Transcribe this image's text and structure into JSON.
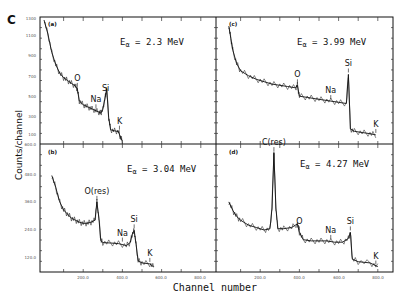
{
  "figure_label": "C",
  "ylabel": "Counts/channel",
  "xlabel": "Channel number",
  "chart_data": [
    {
      "type": "line",
      "panel": "(a)",
      "title": "Eα = 2.3 MeV",
      "energy_label": "2.3 MeV",
      "xlabel": "Channel number",
      "ylabel": "Counts/channel",
      "xlim": [
        0,
        900
      ],
      "ylim": [
        0,
        1300
      ],
      "yticks": [
        "1300",
        "1100",
        "900",
        "700",
        "500",
        "300",
        "100",
        "0.00"
      ],
      "xticks": [],
      "peaks": [
        {
          "label": "O",
          "channel": 170
        },
        {
          "label": "Na",
          "channel": 265
        },
        {
          "label": "Si",
          "channel": 315
        },
        {
          "label": "K",
          "channel": 385
        }
      ],
      "series": [
        {
          "name": "spectrum",
          "x": [
            0,
            20,
            40,
            60,
            80,
            100,
            120,
            140,
            160,
            170,
            180,
            200,
            220,
            240,
            260,
            280,
            290,
            300,
            310,
            320,
            330,
            340,
            360,
            380,
            390,
            400
          ],
          "y": [
            1300,
            1150,
            950,
            820,
            730,
            680,
            650,
            620,
            590,
            560,
            430,
            390,
            370,
            350,
            330,
            310,
            300,
            340,
            450,
            560,
            250,
            120,
            110,
            100,
            40,
            0
          ]
        }
      ]
    },
    {
      "type": "line",
      "panel": "(b)",
      "title": "Eα = 3.04 MeV",
      "energy_label": "3.04 MeV",
      "xlabel": "Channel number",
      "ylabel": "Counts/channel",
      "xlim": [
        0,
        900
      ],
      "ylim": [
        0,
        600
      ],
      "yticks": [
        "600.0",
        "480.0",
        "360.0",
        "240.0",
        "120.0"
      ],
      "xticks": [
        "200.0",
        "400.0",
        "600.0",
        "800.0"
      ],
      "peaks": [
        {
          "label": "O(res)",
          "channel": 270
        },
        {
          "label": "Na",
          "channel": 400
        },
        {
          "label": "Si",
          "channel": 460
        },
        {
          "label": "K",
          "channel": 540
        }
      ],
      "series": [
        {
          "name": "spectrum",
          "x": [
            40,
            60,
            80,
            100,
            120,
            140,
            160,
            180,
            200,
            220,
            240,
            260,
            270,
            280,
            290,
            300,
            340,
            380,
            420,
            440,
            450,
            460,
            470,
            480,
            500,
            540,
            560
          ],
          "y": [
            460,
            400,
            330,
            290,
            270,
            250,
            240,
            230,
            225,
            225,
            230,
            240,
            330,
            250,
            140,
            130,
            128,
            125,
            115,
            130,
            170,
            190,
            120,
            40,
            30,
            25,
            10
          ]
        }
      ]
    },
    {
      "type": "line",
      "panel": "(c)",
      "title": "Eα = 3.99 MeV",
      "energy_label": "3.99 MeV",
      "xlabel": "Channel number",
      "ylabel": "Counts/channel",
      "xlim": [
        0,
        900
      ],
      "ylim": [
        0,
        100
      ],
      "yticks": [],
      "xticks": [],
      "peaks": [
        {
          "label": "O",
          "channel": 390
        },
        {
          "label": "Na",
          "channel": 560
        },
        {
          "label": "Si",
          "channel": 650
        },
        {
          "label": "K",
          "channel": 790
        }
      ],
      "series": [
        {
          "name": "spectrum",
          "x": [
            40,
            50,
            60,
            80,
            100,
            140,
            180,
            220,
            260,
            300,
            340,
            380,
            390,
            400,
            440,
            480,
            520,
            560,
            600,
            640,
            650,
            660,
            680,
            720,
            760,
            790
          ],
          "y": [
            95,
            85,
            75,
            64,
            58,
            54,
            51,
            49,
            47,
            46,
            45,
            44,
            46,
            37,
            36,
            35,
            34,
            33,
            32,
            31,
            55,
            10,
            8,
            7,
            6,
            5
          ]
        }
      ]
    },
    {
      "type": "line",
      "panel": "(d)",
      "title": "Eα = 4.27 MeV",
      "energy_label": "4.27 MeV",
      "xlabel": "Channel number",
      "ylabel": "Counts/channel",
      "xlim": [
        0,
        900
      ],
      "ylim": [
        0,
        100
      ],
      "yticks": [],
      "xticks": [
        "200.0",
        "400.0",
        "600.0",
        "800.0"
      ],
      "peaks": [
        {
          "label": "C(res)",
          "channel": 270
        },
        {
          "label": "O",
          "channel": 400
        },
        {
          "label": "Na",
          "channel": 560
        },
        {
          "label": "Si",
          "channel": 660
        },
        {
          "label": "K",
          "channel": 790
        }
      ],
      "series": [
        {
          "name": "spectrum",
          "x": [
            40,
            60,
            80,
            100,
            140,
            180,
            220,
            250,
            260,
            270,
            280,
            290,
            320,
            360,
            390,
            400,
            420,
            460,
            500,
            540,
            580,
            620,
            650,
            660,
            670,
            700,
            760,
            800
          ],
          "y": [
            55,
            48,
            43,
            40,
            36,
            34,
            32,
            33,
            50,
            95,
            50,
            33,
            33,
            34,
            37,
            30,
            24,
            23,
            23,
            23,
            22,
            22,
            25,
            30,
            8,
            6,
            5,
            2
          ]
        }
      ]
    }
  ]
}
